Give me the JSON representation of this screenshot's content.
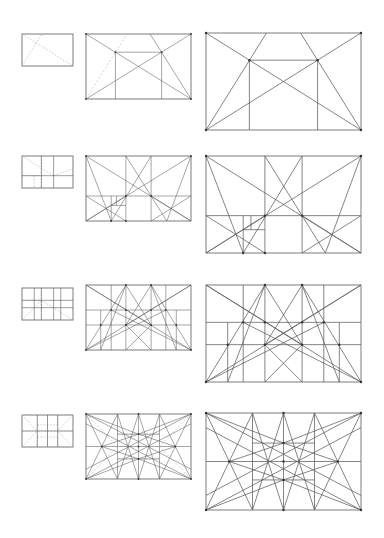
{
  "figure": {
    "title": "",
    "line_color": "#5c5c5c",
    "dash_color": "#a8a8a8",
    "background": "#ffffff"
  },
  "scales": [
    {
      "name": "small",
      "x": 22,
      "w": 51,
      "h": 32
    },
    {
      "name": "medium",
      "x": 86,
      "w": 105,
      "h": 65
    },
    {
      "name": "large",
      "x": 206,
      "w": 155,
      "h": 97
    }
  ],
  "rows": [
    {
      "id": "stage-1",
      "ys": [
        34,
        34,
        33
      ],
      "lines": [
        [
          0,
          0,
          1,
          1
        ],
        [
          0,
          1,
          1,
          0
        ],
        [
          1,
          1,
          0.61,
          0
        ],
        [
          0.28,
          0.28,
          0.72,
          0.28
        ],
        [
          0.28,
          0.28,
          0.28,
          1
        ],
        [
          0.72,
          0.28,
          0.72,
          1
        ]
      ],
      "dashed_small": [
        [
          0,
          1,
          0.39,
          0
        ],
        [
          0,
          0,
          1,
          1
        ],
        [
          0.39,
          0,
          0.39,
          0.04
        ]
      ],
      "dashed_medium": [
        [
          0,
          1,
          0.39,
          0
        ]
      ],
      "solid_large_extra": [
        [
          0,
          1,
          0.39,
          0
        ]
      ],
      "nodes": [
        [
          0.28,
          0.28
        ],
        [
          0.72,
          0.28
        ],
        [
          0,
          0
        ],
        [
          1,
          0
        ],
        [
          0,
          1
        ],
        [
          1,
          1
        ]
      ]
    },
    {
      "id": "stage-2",
      "ys": [
        156,
        156,
        156
      ],
      "lines": [
        [
          0,
          0,
          1,
          1
        ],
        [
          1,
          0,
          0,
          1
        ],
        [
          0.38,
          0,
          0.38,
          1
        ],
        [
          0.62,
          0,
          0.62,
          1
        ],
        [
          0,
          0.615,
          1,
          0.615
        ],
        [
          0,
          0,
          0.24,
          1
        ],
        [
          1,
          0,
          0.77,
          1
        ],
        [
          0.38,
          0,
          0.77,
          1
        ],
        [
          0.62,
          0,
          0.24,
          1
        ],
        [
          0,
          0.615,
          0.38,
          1
        ],
        [
          0,
          1,
          0.38,
          0.615
        ],
        [
          0.62,
          0.615,
          1,
          1
        ],
        [
          0.62,
          1,
          1,
          0.615
        ],
        [
          0.24,
          0.615,
          0.24,
          1
        ],
        [
          0.24,
          0.76,
          0.38,
          0.76
        ],
        [
          0.29,
          0.615,
          0.29,
          0.76
        ]
      ],
      "dashed_small": [
        [
          0,
          0,
          0.62,
          0.615
        ],
        [
          0.62,
          0.615,
          1,
          0.4
        ],
        [
          0.38,
          0,
          0.38,
          1
        ],
        [
          0,
          0.615,
          0.38,
          0.615
        ],
        [
          0.24,
          0.615,
          0.24,
          1
        ]
      ],
      "nodes": [
        [
          0,
          0
        ],
        [
          1,
          0
        ],
        [
          0.38,
          0.615
        ],
        [
          0.62,
          0.615
        ],
        [
          0.24,
          1
        ],
        [
          0.38,
          1
        ]
      ]
    },
    {
      "id": "stage-3",
      "ys": [
        288,
        285,
        285
      ],
      "lines": [
        [
          0.24,
          0,
          0.24,
          1
        ],
        [
          0.38,
          0,
          0.38,
          1
        ],
        [
          0.62,
          0,
          0.62,
          1
        ],
        [
          0.76,
          0,
          0.76,
          1
        ],
        [
          0,
          0.385,
          1,
          0.385
        ],
        [
          0,
          0.615,
          1,
          0.615
        ],
        [
          0,
          0,
          1,
          1
        ],
        [
          1,
          0,
          0,
          1
        ],
        [
          0,
          1,
          0.38,
          0
        ],
        [
          1,
          1,
          0.62,
          0
        ],
        [
          0,
          0,
          0.62,
          0.615
        ],
        [
          1,
          0,
          0.38,
          0.615
        ],
        [
          0.38,
          0,
          0.62,
          0.615
        ],
        [
          0.62,
          0,
          0.38,
          0.615
        ],
        [
          0.38,
          0,
          0.14,
          1
        ],
        [
          0.62,
          0,
          0.86,
          1
        ],
        [
          0.38,
          0.615,
          0.62,
          1
        ],
        [
          0.62,
          0.615,
          0.38,
          1
        ],
        [
          0,
          1,
          0.76,
          0.385
        ],
        [
          1,
          1,
          0.24,
          0.385
        ],
        [
          0.14,
          0.385,
          0.14,
          1
        ],
        [
          0.86,
          0.385,
          0.86,
          1
        ]
      ],
      "dashed_small": [
        [
          0,
          1,
          0.38,
          0.385
        ],
        [
          0.38,
          0.385,
          1,
          1
        ],
        [
          0.38,
          0,
          0.38,
          1
        ],
        [
          0,
          0.385,
          0.38,
          0.385
        ]
      ],
      "nodes": [
        [
          0.24,
          0.385
        ],
        [
          0.38,
          0.385
        ],
        [
          0.62,
          0.385
        ],
        [
          0.76,
          0.385
        ],
        [
          0.38,
          0.615
        ],
        [
          0.62,
          0.615
        ],
        [
          0.14,
          0.615
        ],
        [
          0.86,
          0.615
        ],
        [
          0,
          1
        ],
        [
          1,
          1
        ],
        [
          0.38,
          0
        ],
        [
          0.62,
          0
        ]
      ]
    },
    {
      "id": "stage-4",
      "ys": [
        415,
        414,
        413
      ],
      "lines": [
        [
          0.3,
          0,
          0.3,
          1
        ],
        [
          0.5,
          0,
          0.5,
          1
        ],
        [
          0.7,
          0,
          0.7,
          1
        ],
        [
          0,
          0.5,
          1,
          0.5
        ],
        [
          0,
          0,
          0.3,
          1
        ],
        [
          0.3,
          0,
          0,
          1
        ],
        [
          1,
          0,
          0.7,
          1
        ],
        [
          0.7,
          0,
          1,
          1
        ],
        [
          0.5,
          0,
          0.3,
          1
        ],
        [
          0.5,
          0,
          0.7,
          1
        ],
        [
          0.3,
          0,
          0.5,
          1
        ],
        [
          0.7,
          0,
          0.5,
          1
        ],
        [
          0,
          0,
          0.5,
          0.31
        ],
        [
          1,
          0,
          0.5,
          0.31
        ],
        [
          0,
          1,
          0.5,
          0.69
        ],
        [
          1,
          1,
          0.5,
          0.69
        ],
        [
          0,
          0,
          1,
          0.85
        ],
        [
          1,
          0,
          0,
          0.85
        ],
        [
          0,
          1,
          1,
          0.15
        ],
        [
          1,
          1,
          0,
          0.15
        ],
        [
          0.15,
          0.5,
          0.5,
          0.31
        ],
        [
          0.85,
          0.5,
          0.5,
          0.31
        ],
        [
          0.15,
          0.5,
          0.5,
          0.69
        ],
        [
          0.85,
          0.5,
          0.5,
          0.69
        ],
        [
          0.3,
          0.31,
          0.7,
          0.31
        ],
        [
          0.3,
          0.69,
          0.7,
          0.69
        ]
      ],
      "dashed_small": [
        [
          0,
          0.5,
          1,
          0.5
        ],
        [
          0.5,
          0,
          0.5,
          1
        ],
        [
          0.3,
          0,
          0.3,
          1
        ],
        [
          0.7,
          0,
          0.7,
          1
        ],
        [
          0,
          0,
          0.3,
          0.5
        ],
        [
          1,
          0,
          0.7,
          0.5
        ],
        [
          0,
          1,
          0.3,
          0.5
        ],
        [
          1,
          1,
          0.7,
          0.5
        ],
        [
          0.3,
          0.31,
          0.7,
          0.31
        ],
        [
          0.3,
          0.69,
          0.7,
          0.69
        ]
      ],
      "nodes": [
        [
          0.15,
          0.5
        ],
        [
          0.85,
          0.5
        ],
        [
          0.5,
          0.31
        ],
        [
          0.5,
          0.69
        ],
        [
          0.5,
          0.5
        ],
        [
          0,
          0
        ],
        [
          1,
          0
        ],
        [
          0,
          1
        ],
        [
          1,
          1
        ],
        [
          0.5,
          0
        ],
        [
          0.5,
          1
        ]
      ]
    }
  ]
}
